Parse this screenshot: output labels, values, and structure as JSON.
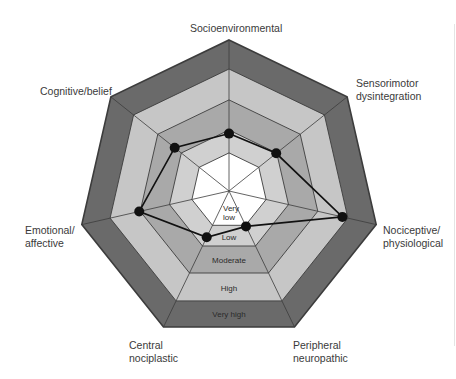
{
  "chart_data": {
    "type": "radar",
    "title": "",
    "axes": [
      "Socioenvironmental",
      "Sensorimotor dysintegration",
      "Nociceptive/ physiological",
      "Peripheral neuropathic",
      "Central nociplastic",
      "Emotional/ affective",
      "Cognitive/belief"
    ],
    "levels": [
      "Very low",
      "Low",
      "Moderate",
      "High",
      "Very high"
    ],
    "level_boundaries": [
      0.25,
      0.4,
      0.6,
      0.81,
      1.0
    ],
    "range": [
      0,
      1
    ],
    "series": [
      {
        "name": "Profile",
        "values": [
          0.38,
          0.4,
          0.77,
          0.26,
          0.34,
          0.61,
          0.46
        ],
        "levels": [
          "Low",
          "Moderate",
          "High",
          "Low",
          "Low",
          "High",
          "Moderate"
        ]
      }
    ],
    "legend": "none",
    "grid": true
  },
  "geometry": {
    "center": [
      229,
      191
    ],
    "outer_radius": 151,
    "ring_fractions": [
      1.0,
      0.808,
      0.603,
      0.404,
      0.252
    ]
  },
  "colors": {
    "very_high": "#6a6a6a",
    "high": "#c6c6c6",
    "moderate": "#a9a9a9",
    "low": "#d0d0d0",
    "very_low": "#ffffff",
    "grid_line": "#3c3c3c",
    "series": "#111111",
    "label": "#3a3a3a"
  },
  "labels": {
    "socio": "Socioenvironmental",
    "sensorimotor_1": "Sensorimotor",
    "sensorimotor_2": "dysintegration",
    "nociceptive_1": "Nociceptive/",
    "nociceptive_2": "physiological",
    "peripheral_1": "Peripheral",
    "peripheral_2": "neuropathic",
    "central_1": "Central",
    "central_2": "nociplastic",
    "emotional_1": "Emotional/",
    "emotional_2": "affective",
    "cognitive": "Cognitive/belief",
    "band_very_low_1": "Very",
    "band_very_low_2": "low",
    "band_low": "Low",
    "band_moderate": "Moderate",
    "band_high": "High",
    "band_very_high": "Very high"
  }
}
